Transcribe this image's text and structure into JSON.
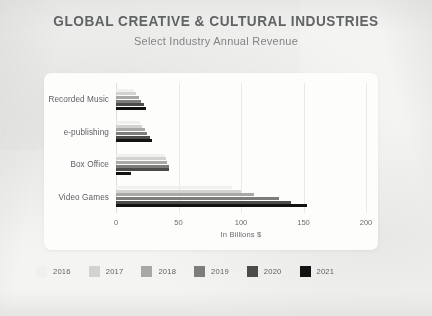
{
  "header": {
    "title": "GLOBAL CREATIVE & CULTURAL INDUSTRIES",
    "subtitle": "Select Industry Annual Revenue"
  },
  "colors": {
    "panel": "#fdfdfc",
    "background": "#f4f4f2",
    "title_text": "#55585a",
    "axis_text": "#6a6d6f",
    "gridline": "#e9e9e7",
    "series": [
      "#f0f0ee",
      "#d2d2d0",
      "#a8a8a6",
      "#7d7d7b",
      "#4c4c4a",
      "#121212"
    ]
  },
  "chart_data": {
    "type": "bar",
    "orientation": "horizontal",
    "title": "GLOBAL CREATIVE & CULTURAL INDUSTRIES",
    "subtitle": "Select Industry Annual Revenue",
    "xlabel": "In Billions $",
    "ylabel": "",
    "xlim": [
      0,
      200
    ],
    "xticks": [
      0,
      50,
      100,
      150,
      200
    ],
    "grid": true,
    "legend_position": "bottom",
    "categories": [
      "Recorded Music",
      "e-publishing",
      "Box Office",
      "Video Games"
    ],
    "series": [
      {
        "name": "2016",
        "color": "#f0f0ee",
        "values": [
          14,
          19,
          39,
          93
        ]
      },
      {
        "name": "2017",
        "color": "#d2d2d0",
        "values": [
          16,
          21,
          40,
          100
        ]
      },
      {
        "name": "2018",
        "color": "#a8a8a6",
        "values": [
          18,
          23,
          41,
          110
        ]
      },
      {
        "name": "2019",
        "color": "#7d7d7b",
        "values": [
          20,
          25,
          42,
          130
        ]
      },
      {
        "name": "2020",
        "color": "#4c4c4a",
        "values": [
          22,
          27,
          42,
          140
        ]
      },
      {
        "name": "2021",
        "color": "#121212",
        "values": [
          24,
          29,
          12,
          153
        ]
      }
    ]
  }
}
